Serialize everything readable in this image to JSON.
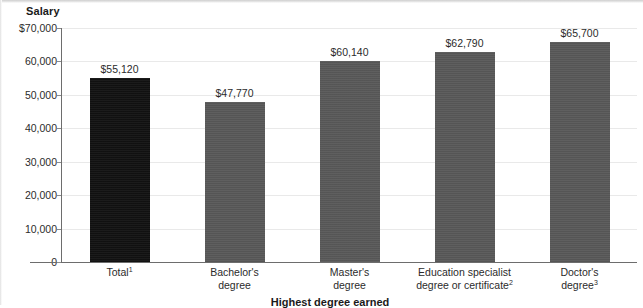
{
  "chart_data": {
    "type": "bar",
    "title": "",
    "ylabel": "Salary",
    "xlabel": "Highest degree earned",
    "categories": [
      "Total¹",
      "Bachelor's degree",
      "Master's degree",
      "Education specialist degree or certificate²",
      "Doctor's degree³"
    ],
    "values": [
      55120,
      47770,
      60140,
      62790,
      65700
    ],
    "value_labels": [
      "$55,120",
      "$47,770",
      "$60,140",
      "$62,790",
      "$65,700"
    ],
    "ylim": [
      0,
      70000
    ],
    "ytick_labels": [
      "$70,000",
      "60,000",
      "50,000",
      "40,000",
      "30,000",
      "20,000",
      "10,000",
      "0"
    ],
    "ytick_values": [
      70000,
      60000,
      50000,
      40000,
      30000,
      20000,
      10000,
      0
    ],
    "grid": true,
    "legend": "none",
    "bar_colors": [
      "#111111",
      "#585858",
      "#585858",
      "#585858",
      "#585858"
    ]
  },
  "axes": {
    "y_title": "Salary",
    "x_title": "Highest degree earned"
  },
  "categories_lines": [
    [
      "Total¹"
    ],
    [
      "Bachelor's",
      "degree"
    ],
    [
      "Master's",
      "degree"
    ],
    [
      "Education specialist",
      "degree or certificate²"
    ],
    [
      "Doctor's",
      "degree³"
    ]
  ],
  "colors": {
    "bar_highlight": "#111111",
    "bar_default": "#585858",
    "gridline": "#e9e9e9",
    "axis": "#6d6d6d",
    "text": "#2b2b2b"
  }
}
